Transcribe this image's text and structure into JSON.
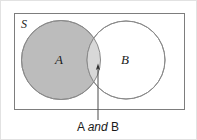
{
  "figure": {
    "type": "venn-diagram",
    "universe_label": "S",
    "set_a_label": "A",
    "set_b_label": "B",
    "caption": {
      "prefix": "A",
      "connective": "and",
      "suffix": "B",
      "full_text": "A and B"
    }
  },
  "colors": {
    "set_a_fill": "#bcbcbc",
    "set_b_fill": "#ffffff",
    "intersection_fill": "#d8d8d8",
    "stroke": "#8a8a8a",
    "universe_stroke": "#7d7d7d",
    "outer_border": "#e2e2e2",
    "text": "#1a1a1a",
    "leader_line": "#4a4a4a"
  },
  "geometry": {
    "canvas": {
      "width": 197,
      "height": 140
    },
    "universe_rect": {
      "x": 14,
      "y": 13,
      "width": 171,
      "height": 97
    },
    "circle_a": {
      "cx": 61,
      "cy": 60,
      "r": 39.5
    },
    "circle_b": {
      "cx": 126,
      "cy": 60,
      "r": 39
    },
    "leader_line": {
      "x": 98,
      "y_top": 66,
      "y_bottom": 120
    },
    "label_a_pos": {
      "x": 59,
      "y": 64
    },
    "label_b_pos": {
      "x": 125,
      "y": 64
    },
    "universe_label_pos": {
      "x": 21,
      "y": 28
    },
    "caption_pos": {
      "x": 98,
      "y": 131
    }
  }
}
